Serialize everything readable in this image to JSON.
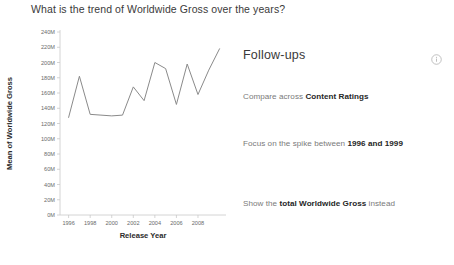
{
  "question": {
    "text": "What is the trend of Worldwide Gross over the years?"
  },
  "followups": {
    "title": "Follow-ups",
    "info_icon": "info-circle-icon",
    "items": [
      {
        "prefix": "Compare across ",
        "strong": "Content Ratings",
        "suffix": ""
      },
      {
        "prefix": "Focus on the spike between ",
        "strong": "1996 and 1999",
        "suffix": ""
      },
      {
        "prefix": "Show the ",
        "strong": "total Worldwide Gross",
        "suffix": " instead"
      }
    ]
  },
  "chart_data": {
    "type": "line",
    "title": "",
    "xlabel": "Release Year",
    "ylabel": "Mean of Worldwide Gross",
    "x": [
      1996,
      1997,
      1998,
      1999,
      2000,
      2001,
      2002,
      2003,
      2004,
      2005,
      2006,
      2007,
      2008,
      2009,
      2010
    ],
    "values": [
      128000000,
      182000000,
      132000000,
      131000000,
      130000000,
      131000000,
      168000000,
      150000000,
      200000000,
      192000000,
      145000000,
      198000000,
      158000000,
      190000000,
      218000000
    ],
    "xtick_labels": [
      "1996",
      "1998",
      "2000",
      "2002",
      "2004",
      "2006",
      "2008"
    ],
    "xtick_values": [
      1996,
      1998,
      2000,
      2002,
      2004,
      2006,
      2008
    ],
    "ytick_labels": [
      "0M",
      "20M",
      "40M",
      "60M",
      "80M",
      "100M",
      "120M",
      "140M",
      "160M",
      "180M",
      "200M",
      "220M",
      "240M"
    ],
    "ytick_values": [
      0,
      20000000,
      40000000,
      60000000,
      80000000,
      100000000,
      120000000,
      140000000,
      160000000,
      180000000,
      200000000,
      220000000,
      240000000
    ],
    "xlim": [
      1995.2,
      2010.6
    ],
    "ylim": [
      0,
      240000000
    ],
    "grid": false,
    "legend": false,
    "line_color": "#8a8a8a"
  }
}
